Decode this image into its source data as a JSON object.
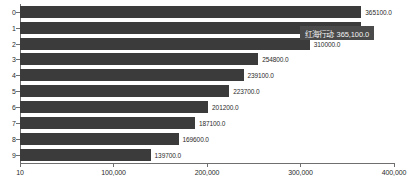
{
  "chart_data": {
    "type": "bar",
    "orientation": "horizontal",
    "title": "",
    "xlabel": "",
    "ylabel": "",
    "categories": [
      "0",
      "1",
      "2",
      "3",
      "4",
      "5",
      "6",
      "7",
      "8",
      "9"
    ],
    "values": [
      365100.0,
      365100.0,
      310000.0,
      254800.0,
      239100.0,
      223700.0,
      201200.0,
      187100.0,
      169600.0,
      139700.0
    ],
    "data_labels": [
      "365100.0",
      "",
      "310000.0",
      "254800.0",
      "239100.0",
      "223700.0",
      "201200.0",
      "187100.0",
      "169600.0",
      "139700.0"
    ],
    "xlim": [
      10,
      400000
    ],
    "x_ticks": [
      10,
      100000,
      200000,
      300000,
      400000
    ],
    "x_tick_labels": [
      "10",
      "100,000",
      "200,000",
      "300,000",
      "400,000"
    ],
    "y_tick_labels": [
      "0",
      "1",
      "2",
      "3",
      "4",
      "5",
      "6",
      "7",
      "8",
      "9"
    ],
    "grid": false,
    "legend": "none",
    "bar_color": "#3b3b3b",
    "axis_color": "#6f6f6f",
    "background_color": "#ffffff"
  },
  "tooltip": {
    "visible": true,
    "text": "红海行动: 365,100.0",
    "series_name": "红海行动",
    "value": "365,100.0",
    "background_color": "#4a4a4a",
    "text_color": "#f2f2f2"
  }
}
